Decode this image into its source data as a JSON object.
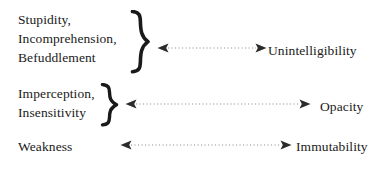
{
  "diagram": {
    "type": "correspondence-diagram",
    "background_color": "#ffffff",
    "text_color": "#1a1a1a",
    "dotted_line_color": "#b5b5b5",
    "arrowhead_color": "#2b2b2b",
    "rows": [
      {
        "id": "row-unintelligibility",
        "left_terms": [
          "Stupidity,",
          "Incomprehension,",
          "Befuddlement"
        ],
        "brace": "}",
        "has_brace": true,
        "connector": "dotted-double-headed-arrow",
        "right_label": "Unintelligibility"
      },
      {
        "id": "row-opacity",
        "left_terms": [
          "Imperception,",
          "Insensitivity"
        ],
        "brace": "}",
        "has_brace": true,
        "connector": "dotted-double-headed-arrow",
        "right_label": "Opacity"
      },
      {
        "id": "row-immutability",
        "left_terms": [
          "Weakness"
        ],
        "brace": "",
        "has_brace": false,
        "connector": "dotted-double-headed-arrow",
        "right_label": "Immutability"
      }
    ]
  }
}
